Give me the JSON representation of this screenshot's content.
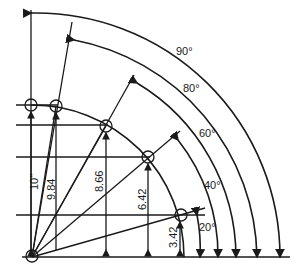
{
  "diagram": {
    "radius_label": "10\"",
    "angles": [
      {
        "label": "20°",
        "height_label": "3.42"
      },
      {
        "label": "40°",
        "height_label": "6.42"
      },
      {
        "label": "60°",
        "height_label": "8.66"
      },
      {
        "label": "80°",
        "height_label": "9.84"
      },
      {
        "label": "90°",
        "height_label": "10\""
      }
    ]
  },
  "labels": {
    "a90": "90°",
    "a80": "80°",
    "a60": "60°",
    "a40": "40°",
    "a20": "20°",
    "h10": "10\"",
    "h984": "9.84",
    "h866": "8.66",
    "h642": "6.42",
    "h342": "3.42"
  },
  "colors": {
    "stroke": "#1a1a1a",
    "background": "#ffffff"
  }
}
